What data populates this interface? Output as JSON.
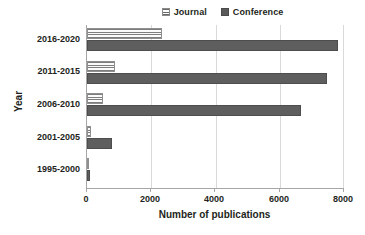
{
  "chart_data": {
    "type": "bar",
    "orientation": "horizontal",
    "title": "",
    "xlabel": "Number of publications",
    "ylabel": "Year",
    "categories": [
      "1995-2000",
      "2001-2005",
      "2006-2010",
      "2011-2015",
      "2016-2020"
    ],
    "series": [
      {
        "name": "Journal",
        "values": [
          70,
          120,
          510,
          870,
          2330
        ]
      },
      {
        "name": "Conference",
        "values": [
          90,
          790,
          6660,
          7480,
          7810
        ]
      }
    ],
    "xlim": [
      0,
      8000
    ],
    "xticks": [
      0,
      2000,
      4000,
      6000,
      8000
    ],
    "xtick_labels": [
      "0",
      "2000",
      "4000",
      "6000",
      "8000"
    ],
    "grid": true,
    "grid_axis": "x",
    "legend": {
      "position": "top-right",
      "entries": [
        {
          "label": "Journal",
          "marker": "striped-swatch-icon",
          "color": "#e8e8e8"
        },
        {
          "label": "Conference",
          "marker": "solid-swatch-icon",
          "color": "#5a5a5a"
        }
      ]
    }
  }
}
